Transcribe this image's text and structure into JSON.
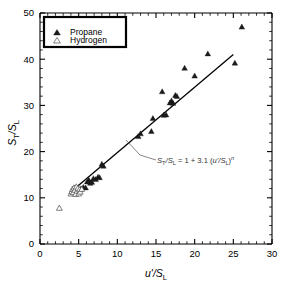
{
  "chart_data": {
    "type": "scatter",
    "title": "",
    "xlabel": "u'/S_L",
    "ylabel": "S_T/S_L",
    "xlim": [
      0,
      30
    ],
    "ylim": [
      0,
      50
    ],
    "xticks": [
      0,
      5,
      10,
      15,
      20,
      25,
      30
    ],
    "yticks": [
      0,
      10,
      20,
      30,
      40,
      50
    ],
    "xtick_labels": [
      "0",
      "5",
      "10",
      "15",
      "20",
      "25",
      "30"
    ],
    "ytick_labels": [
      "0",
      "10",
      "20",
      "30",
      "40",
      "50"
    ],
    "x_minor_step": 1,
    "y_minor_step": 2,
    "grid": false,
    "legend_position": "top-left",
    "series": [
      {
        "name": "Propane",
        "marker": "filled-triangle",
        "color": "#1a1a1a",
        "points": [
          [
            5.0,
            11.6
          ],
          [
            5.3,
            12.0
          ],
          [
            5.6,
            12.3
          ],
          [
            5.9,
            12.2
          ],
          [
            6.1,
            13.5
          ],
          [
            6.3,
            13.9
          ],
          [
            6.5,
            13.2
          ],
          [
            6.7,
            13.4
          ],
          [
            6.9,
            14.2
          ],
          [
            7.2,
            14.0
          ],
          [
            7.5,
            14.5
          ],
          [
            7.7,
            14.4
          ],
          [
            8.0,
            17.3
          ],
          [
            8.2,
            16.9
          ],
          [
            12.7,
            23.3
          ],
          [
            13.0,
            23.9
          ],
          [
            14.4,
            24.4
          ],
          [
            14.6,
            27.2
          ],
          [
            15.8,
            33.0
          ],
          [
            16.0,
            27.9
          ],
          [
            16.3,
            28.0
          ],
          [
            16.8,
            30.6
          ],
          [
            17.0,
            31.0
          ],
          [
            17.2,
            30.5
          ],
          [
            17.5,
            32.2
          ],
          [
            17.7,
            32.0
          ],
          [
            18.7,
            38.1
          ],
          [
            20.0,
            36.4
          ],
          [
            21.7,
            41.2
          ],
          [
            25.2,
            39.2
          ],
          [
            26.1,
            47.0
          ]
        ]
      },
      {
        "name": "Hydrogen",
        "marker": "open-triangle",
        "color": "#4a4a4a",
        "points": [
          [
            2.5,
            7.8
          ],
          [
            4.0,
            10.9
          ],
          [
            4.1,
            11.4
          ],
          [
            4.2,
            11.9
          ],
          [
            4.3,
            11.2
          ],
          [
            4.4,
            12.2
          ],
          [
            4.5,
            11.7
          ],
          [
            4.6,
            10.8
          ],
          [
            4.7,
            12.4
          ],
          [
            4.8,
            11.5
          ],
          [
            4.9,
            12.1
          ],
          [
            5.0,
            10.9
          ],
          [
            5.1,
            11.8
          ],
          [
            5.2,
            11.3
          ],
          [
            5.4,
            11.9
          ]
        ]
      }
    ],
    "fit_line": {
      "label": "S_T/S_L = 1 + 3.1 (u'/S_L)^n",
      "x_start": 4.2,
      "y_start": 11.6,
      "x_end": 25.0,
      "y_end": 41.0
    },
    "annotation": {
      "equation_parts": {
        "lhs_s": "S",
        "lhs_sub1": "T",
        "slash": "/",
        "lhs_s2": "S",
        "lhs_sub2": "L",
        "equals": " = 1 + 3.1 (",
        "rhs_u": "u'",
        "rhs_slash": "/",
        "rhs_s": "S",
        "rhs_sub": "L",
        "close": ")",
        "exponent": "n"
      },
      "full_text": "S_T/S_L = 1 + 3.1 (u'/S_L)^n"
    }
  },
  "axes": {
    "y_label_main": "S",
    "y_label_sub1": "T",
    "y_label_slash": "/",
    "y_label_main2": "S",
    "y_label_sub2": "L",
    "x_label_main": "u'",
    "x_label_slash": "/",
    "x_label_main2": "S",
    "x_label_sub": "L"
  },
  "legend": {
    "items": [
      {
        "label": "Propane",
        "marker": "filled-triangle"
      },
      {
        "label": "Hydrogen",
        "marker": "open-triangle"
      }
    ]
  }
}
